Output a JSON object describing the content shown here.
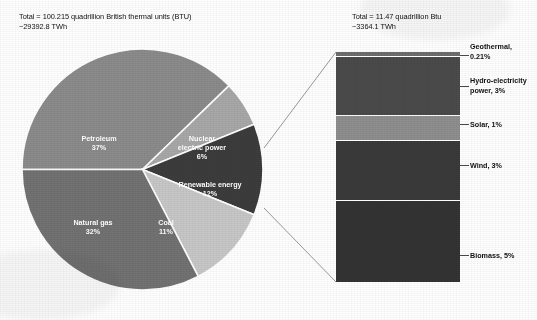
{
  "headers": {
    "left": "Total = 100.215 quadrillion British thermal units (BTU)\n  ~29392.8 TWh",
    "right": "Total = 11.47 quadrillion Btu\n  ~3364.1 TWh"
  },
  "chart_data": {
    "type": "pie",
    "title": "",
    "total_label_main": "Total = 100.215 quadrillion British thermal units (BTU)",
    "total_label_main_twh": "~29392.8 TWh",
    "total_label_breakout": "Total = 11.47 quadrillion Btu",
    "total_label_breakout_twh": "~3364.1 TWh",
    "units": "quadrillion Btu",
    "categories": [
      "Petroleum",
      "Nuclear electric power",
      "Renewable energy",
      "Coal",
      "Natural gas"
    ],
    "values": [
      37,
      6,
      12,
      11,
      32
    ],
    "slices": [
      {
        "name": "Petroleum",
        "label": "Petroleum",
        "pct_text": "37%",
        "value": 37,
        "color": "#8b8b8b",
        "label_x": 78,
        "label_y": 93,
        "lines": 1
      },
      {
        "name": "Nuclear electric power",
        "label": "Nuclear\nelectric power",
        "pct_text": "6%",
        "value": 6,
        "color": "#a8a8a8",
        "label_x": 181,
        "label_y": 93,
        "lines": 2
      },
      {
        "name": "Renewable energy",
        "label": "Renewable energy",
        "pct_text": "12%",
        "value": 12,
        "color": "#3c3c3c",
        "label_x": 189,
        "label_y": 139,
        "lines": 1
      },
      {
        "name": "Coal",
        "label": "Coal",
        "pct_text": "11%",
        "value": 11,
        "color": "#c7c7c7",
        "label_x": 145,
        "label_y": 177,
        "lines": 1
      },
      {
        "name": "Natural gas",
        "label": "Natural gas",
        "pct_text": "32%",
        "value": 32,
        "color": "#727272",
        "label_x": 72,
        "label_y": 177,
        "lines": 1
      }
    ],
    "breakout": {
      "type": "bar",
      "of_slice": "Renewable energy",
      "categories": [
        "Geothermal",
        "Hydro-electricity power",
        "Solar",
        "Wind",
        "Biomass"
      ],
      "values": [
        0.21,
        3,
        1,
        3,
        5
      ],
      "segments": [
        {
          "name": "Geothermal",
          "label": "Geothermal,\n0.21%",
          "pct_text": "0.21%",
          "value": 0.21,
          "color": "#6e6e6e",
          "height_pct": 2.0,
          "label_top": 42,
          "tick_top": 55
        },
        {
          "name": "Hydro-electricity power",
          "label": "Hydro-electricity\npower, 3%",
          "pct_text": "3%",
          "value": 3,
          "color": "#4a4a4a",
          "height_pct": 26.0,
          "label_top": 76,
          "tick_top": 86
        },
        {
          "name": "Solar",
          "label": "Solar, 1%",
          "pct_text": "1%",
          "value": 1,
          "color": "#8e8e8e",
          "height_pct": 10.5,
          "label_top": 120,
          "tick_top": 124
        },
        {
          "name": "Wind",
          "label": "Wind, 3%",
          "pct_text": "3%",
          "value": 3,
          "color": "#3a3a3a",
          "height_pct": 26.5,
          "label_top": 161,
          "tick_top": 165
        },
        {
          "name": "Biomass",
          "label": "Biomass, 5%",
          "pct_text": "5%",
          "value": 5,
          "color": "#333333",
          "height_pct": 35.0,
          "label_top": 251,
          "tick_top": 255
        }
      ]
    },
    "legend_position": "labels-on-slices",
    "grid": false
  }
}
